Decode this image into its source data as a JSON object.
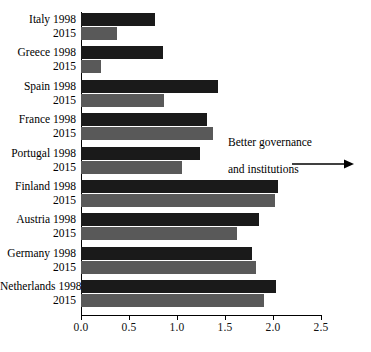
{
  "chart_data": {
    "type": "bar",
    "orientation": "horizontal",
    "title": "",
    "subtitle": "",
    "xlabel": "",
    "ylabel": "",
    "xlim": [
      0.0,
      2.5
    ],
    "grid": false,
    "legend_position": "none",
    "categories": [
      "Italy",
      "Greece",
      "Spain",
      "France",
      "Portugal",
      "Finland",
      "Austria",
      "Germany",
      "Netherlands"
    ],
    "series": [
      {
        "name": "1998",
        "color": "#1a1a1a",
        "values": [
          0.77,
          0.85,
          1.43,
          1.31,
          1.24,
          2.05,
          1.85,
          1.78,
          2.03
        ]
      },
      {
        "name": "2015",
        "color": "#595959",
        "values": [
          0.38,
          0.21,
          0.86,
          1.37,
          1.05,
          2.02,
          1.62,
          1.82,
          1.91
        ]
      }
    ],
    "tick_labels": [
      "0.0",
      "0.5",
      "1.0",
      "1.5",
      "2.0",
      "2.5"
    ],
    "tick_values": [
      0.0,
      0.5,
      1.0,
      1.5,
      2.0,
      2.5
    ],
    "annotations": [
      {
        "text_line_1": "Better governance",
        "text_line_2": "and institutions",
        "arrow": "right-arrow"
      }
    ]
  },
  "axis": {
    "tick_labels": [
      "0.0",
      "0.5",
      "1.0",
      "1.5",
      "2.0",
      "2.5"
    ]
  },
  "rows": [
    {
      "country": "Italy",
      "line1": "Italy 1998",
      "line2": "2015"
    },
    {
      "country": "Greece",
      "line1": "Greece 1998",
      "line2": "2015"
    },
    {
      "country": "Spain",
      "line1": "Spain 1998",
      "line2": "2015"
    },
    {
      "country": "France",
      "line1": "France 1998",
      "line2": "2015"
    },
    {
      "country": "Portugal",
      "line1": "Portugal 1998",
      "line2": "2015"
    },
    {
      "country": "Finland",
      "line1": "Finland 1998",
      "line2": "2015"
    },
    {
      "country": "Austria",
      "line1": "Austria 1998",
      "line2": "2015"
    },
    {
      "country": "Germany",
      "line1": "Germany 1998",
      "line2": "2015"
    },
    {
      "country": "Netherlands",
      "line1": "Netherlands 1998",
      "line2": "2015"
    }
  ],
  "annotation": {
    "line1": "Better governance",
    "line2": "and institutions"
  },
  "colors": {
    "series_1998": "#1a1a1a",
    "series_2015": "#595959",
    "axis": "#000000",
    "background": "#ffffff"
  }
}
